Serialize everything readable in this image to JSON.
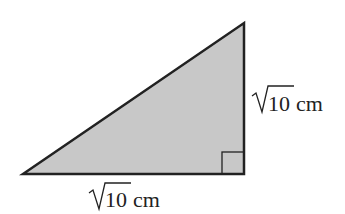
{
  "diagram": {
    "shape": "right-triangle",
    "fill_color": "#c8c8c8",
    "stroke_color": "#222222",
    "vertices": {
      "left": [
        23,
        174
      ],
      "top_right": [
        244,
        23
      ],
      "bottom_right": [
        244,
        174
      ]
    },
    "right_angle_marker": true,
    "labels": {
      "vertical_side": {
        "radical": "10",
        "unit": "cm"
      },
      "horizontal_side": {
        "radical": "10",
        "unit": "cm"
      }
    }
  }
}
